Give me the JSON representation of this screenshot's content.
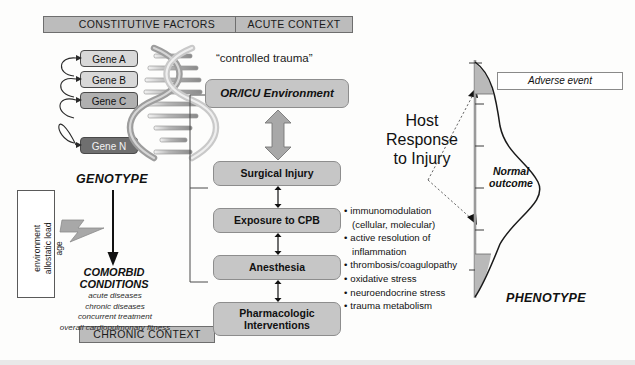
{
  "diagram": {
    "headers": {
      "constitutive": "CONSTITUTIVE FACTORS",
      "acute": "ACUTE CONTEXT",
      "chronic": "CHRONIC CONTEXT"
    },
    "genotype": {
      "label": "GENOTYPE",
      "genes": [
        {
          "name": "Gene A",
          "shade": "light"
        },
        {
          "name": "Gene B",
          "shade": "light"
        },
        {
          "name": "Gene C",
          "shade": "medium"
        },
        {
          "name": "Gene N",
          "shade": "dark"
        }
      ],
      "helix_icon": "dna-double-helix"
    },
    "modifiers": {
      "lines": [
        "environment",
        "allostatic load",
        "age"
      ]
    },
    "comorbid": {
      "title_line1": "COMORBID",
      "title_line2": "CONDITIONS",
      "items": [
        "acute diseases",
        "chronic diseases",
        "concurrent treatment",
        "overall cardiopulmonary fitness"
      ]
    },
    "acute": {
      "quote": "“controlled trauma”",
      "boxes": [
        "OR/ICU Environment",
        "Surgical Injury",
        "Exposure to CPB",
        "Anesthesia",
        "Pharmacologic Interventions"
      ],
      "pharm_line1": "Pharmacologic",
      "pharm_line2": "Interventions"
    },
    "host_response": {
      "title_line1": "Host",
      "title_line2": "Response",
      "title_line3": "to Injury",
      "mechanisms": [
        {
          "text": "immunomodulation",
          "indent": false
        },
        {
          "text": "(cellular, molecular)",
          "indent": true
        },
        {
          "text": "active resolution of",
          "indent": false
        },
        {
          "text": "inflammation",
          "indent": true
        },
        {
          "text": "thrombosis/coagulopathy",
          "indent": false
        },
        {
          "text": "oxidative stress",
          "indent": false
        },
        {
          "text": "neuroendocrine stress",
          "indent": false
        },
        {
          "text": "trauma metabolism",
          "indent": false
        }
      ]
    },
    "phenotype": {
      "label": "PHENOTYPE",
      "adverse_event": "Adverse event",
      "normal_line1": "Normal",
      "normal_line2": "outcome"
    },
    "colors": {
      "chip_fill": "#bcbcbc",
      "box_fill": "#c6c6c6",
      "gene_light": "#d8d8d8",
      "gene_medium": "#b0b0b0",
      "gene_dark": "#6f6f6f",
      "arrow_fill": "#a8a8a8",
      "tail_fill": "#b9b9b9"
    }
  }
}
